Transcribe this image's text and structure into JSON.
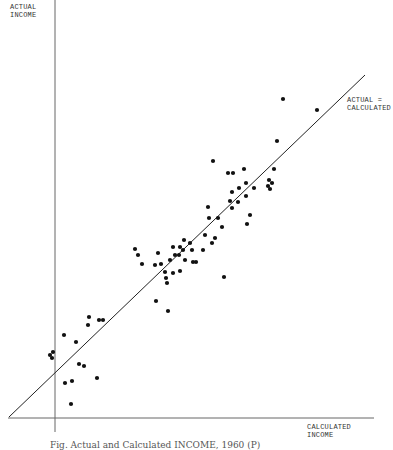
{
  "chart_data": {
    "type": "scatter",
    "title": "",
    "xlabel": "CALCULATED INCOME",
    "ylabel": "ACTUAL INCOME",
    "reference_line": {
      "label": "ACTUAL = CALCULATED",
      "from_px": [
        9,
        417
      ],
      "to_px": [
        365,
        75
      ]
    },
    "grid": false,
    "ticks": false,
    "axes_px": {
      "y_axis_x": 55,
      "x_axis_y": 418,
      "x_start": 8,
      "x_end": 374,
      "y_top": 0
    },
    "points_px": [
      [
        283,
        99
      ],
      [
        317,
        110
      ],
      [
        277,
        141
      ],
      [
        213,
        161
      ],
      [
        228,
        173
      ],
      [
        233,
        173
      ],
      [
        244,
        169
      ],
      [
        274,
        169
      ],
      [
        269,
        180
      ],
      [
        272,
        183
      ],
      [
        268,
        186
      ],
      [
        270,
        189
      ],
      [
        246,
        183
      ],
      [
        254,
        188
      ],
      [
        232,
        192
      ],
      [
        239,
        188
      ],
      [
        230,
        201
      ],
      [
        238,
        202
      ],
      [
        246,
        196
      ],
      [
        232,
        208
      ],
      [
        208,
        207
      ],
      [
        209,
        218
      ],
      [
        250,
        215
      ],
      [
        247,
        224
      ],
      [
        218,
        218
      ],
      [
        222,
        227
      ],
      [
        205,
        235
      ],
      [
        215,
        238
      ],
      [
        203,
        250
      ],
      [
        212,
        243
      ],
      [
        196,
        262
      ],
      [
        193,
        262
      ],
      [
        190,
        243
      ],
      [
        224,
        277
      ],
      [
        184,
        240
      ],
      [
        192,
        250
      ],
      [
        180,
        247
      ],
      [
        183,
        250
      ],
      [
        173,
        247
      ],
      [
        175,
        255
      ],
      [
        179,
        255
      ],
      [
        185,
        260
      ],
      [
        170,
        260
      ],
      [
        158,
        253
      ],
      [
        155,
        265
      ],
      [
        161,
        264
      ],
      [
        142,
        264
      ],
      [
        135,
        249
      ],
      [
        138,
        255
      ],
      [
        165,
        272
      ],
      [
        166,
        278
      ],
      [
        173,
        273
      ],
      [
        180,
        271
      ],
      [
        167,
        283
      ],
      [
        156,
        301
      ],
      [
        168,
        311
      ],
      [
        89,
        317
      ],
      [
        88,
        325
      ],
      [
        99,
        320
      ],
      [
        103,
        320
      ],
      [
        64,
        335
      ],
      [
        76,
        342
      ],
      [
        50,
        355
      ],
      [
        53,
        352
      ],
      [
        52,
        358
      ],
      [
        79,
        364
      ],
      [
        84,
        366
      ],
      [
        65,
        383
      ],
      [
        72,
        381
      ],
      [
        97,
        378
      ],
      [
        71,
        404
      ]
    ]
  },
  "labels": {
    "y_axis_line1": "ACTUAL",
    "y_axis_line2": "INCOME",
    "x_axis_line1": "CALCULATED",
    "x_axis_line2": "INCOME",
    "ref_line1": "ACTUAL =",
    "ref_line2": "CALCULATED"
  },
  "caption": "Fig.  Actual and Calculated INCOME, 1960  (P)",
  "colors": {
    "ink": "#111111",
    "axis": "#555555",
    "background": "#ffffff"
  }
}
